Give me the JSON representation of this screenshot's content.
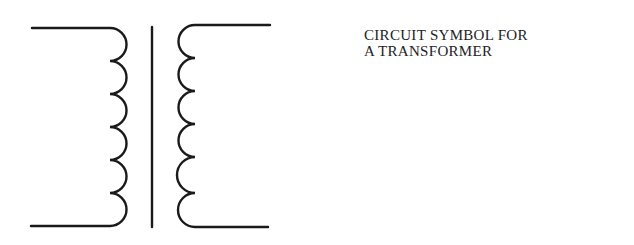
{
  "caption": {
    "line1": "CIRCUIT SYMBOL FOR",
    "line2": "A TRANSFORMER"
  },
  "diagram": {
    "symbol": "transformer",
    "primary_coil_loops": 6,
    "secondary_coil_loops": 6,
    "core": "single vertical line",
    "stroke_color": "#1a1a1a"
  }
}
